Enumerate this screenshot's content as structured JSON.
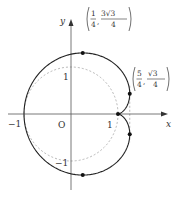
{
  "figure": {
    "type": "parametric-curve-diagram",
    "curve": {
      "description": "limacon/cardioid with cusp at (1,0)",
      "x_expr": "1 + (1 - cos t) cos t",
      "y_expr": "(1 - cos t) sin t",
      "color": "#222222"
    },
    "reference_circle": {
      "description": "unit circle, dashed",
      "center": [
        0,
        0
      ],
      "radius": 1,
      "color": "#999999"
    },
    "reference_line": {
      "description": "dashed vertical line x = 5/4",
      "x": 1.25,
      "color": "#999999"
    },
    "axes": {
      "x_label": "x",
      "y_label": "y",
      "origin_label": "O",
      "x_ticks": [
        {
          "value": -1,
          "label": "−1"
        },
        {
          "value": 1,
          "label": "1"
        }
      ],
      "y_ticks": [
        {
          "value": 1,
          "label": "1"
        },
        {
          "value": -1,
          "label": "−1"
        }
      ]
    },
    "points": [
      {
        "x": 0.25,
        "y": 1.299,
        "label_num_x": "1",
        "label_den_x": "4",
        "label_num_y": "3√3",
        "label_den_y": "4",
        "labeled": true
      },
      {
        "x": 1.25,
        "y": 0.433,
        "label_num_x": "5",
        "label_den_x": "4",
        "label_num_y": "√3",
        "label_den_y": "4",
        "labeled": true
      },
      {
        "x": 1,
        "y": 0,
        "labeled": false
      },
      {
        "x": 1.25,
        "y": -0.433,
        "labeled": false
      },
      {
        "x": 0.25,
        "y": -1.299,
        "labeled": false
      }
    ]
  }
}
